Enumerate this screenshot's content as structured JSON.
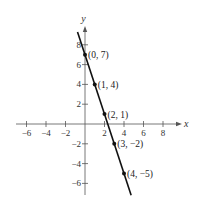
{
  "chart_data": {
    "type": "line",
    "title": "",
    "xlabel": "x",
    "ylabel": "y",
    "xlim": [
      -7,
      9.5
    ],
    "ylim": [
      -7,
      9.5
    ],
    "grid": false,
    "x_ticks": [
      -6,
      -4,
      -2,
      2,
      4,
      6,
      8
    ],
    "y_ticks": [
      -6,
      -4,
      -2,
      2,
      4,
      6,
      8
    ],
    "x_tick_labels": [
      "−6",
      "−4",
      "−2",
      "2",
      "4",
      "6",
      "8"
    ],
    "y_tick_labels": [
      "−6",
      "−4",
      "−2",
      "2",
      "4",
      "6",
      "8"
    ],
    "line": {
      "slope": -3,
      "intercept": 7,
      "equation": "y = -3x + 7",
      "color": "#111111"
    },
    "points": [
      {
        "x": 0,
        "y": 7,
        "label": "(0, 7)"
      },
      {
        "x": 1,
        "y": 4,
        "label": "(1, 4)"
      },
      {
        "x": 2,
        "y": 1,
        "label": "(2, 1)"
      },
      {
        "x": 3,
        "y": -2,
        "label": "(3, −2)"
      },
      {
        "x": 4,
        "y": -5,
        "label": "(4, −5)"
      }
    ]
  }
}
